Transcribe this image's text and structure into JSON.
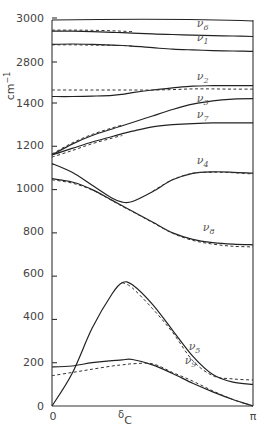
{
  "chart_data": {
    "type": "line",
    "title": "",
    "xlabel": "δC",
    "ylabel": "cm⁻¹",
    "x_ticks": [
      "0",
      "π"
    ],
    "x_range": [
      0,
      3.1416
    ],
    "y_ticks": [
      "0",
      "200",
      "400",
      "600",
      "800",
      "1000",
      "1200",
      "1400",
      "2800",
      "3000"
    ],
    "y_axis_break": [
      1400,
      2800
    ],
    "ylim": [
      0,
      3000
    ],
    "grid": false,
    "legend": "inline curve labels",
    "line_styles": {
      "solid": "calculated",
      "dashed": "second calculation"
    },
    "x": [
      0,
      0.1,
      0.2,
      0.3,
      0.35,
      0.4,
      0.5,
      0.6,
      0.7,
      0.8,
      0.9,
      1.0
    ],
    "x_unit": "fraction of π",
    "series": [
      {
        "name": "ν6",
        "style": "solid",
        "values": [
          2940,
          2940,
          2938,
          2935,
          2933,
          2931,
          2928,
          2925,
          2922,
          2920,
          2918,
          2916
        ]
      },
      {
        "name": "ν6",
        "style": "dashed",
        "values": [
          2945,
          2945,
          2944,
          2942,
          2940,
          2938,
          null,
          null,
          null,
          null,
          null,
          null
        ]
      },
      {
        "name": "ν1",
        "style": "solid",
        "values": [
          2880,
          2882,
          2880,
          2877,
          2875,
          2872,
          2865,
          2858,
          2855,
          2852,
          2850,
          2848
        ]
      },
      {
        "name": "ν1",
        "style": "dashed",
        "values": [
          2878,
          2878,
          2877,
          2876,
          2875,
          2872,
          null,
          null,
          null,
          null,
          null,
          null
        ]
      },
      {
        "name": "ν2",
        "style": "solid",
        "values": [
          1430,
          1430,
          1432,
          1435,
          1440,
          1448,
          1460,
          1470,
          1478,
          1480,
          1480,
          1480
        ]
      },
      {
        "name": "ν2",
        "style": "dashed",
        "values": [
          1460,
          1460,
          1460,
          1460,
          1460,
          1460,
          1460,
          1462,
          1465,
          1465,
          1464,
          1464
        ]
      },
      {
        "name": "ν3",
        "style": "solid",
        "values": [
          1160,
          1210,
          1250,
          1280,
          1295,
          1310,
          1340,
          1370,
          1395,
          1410,
          1418,
          1420
        ]
      },
      {
        "name": "ν3",
        "style": "dashed",
        "values": [
          1165,
          1215,
          1255,
          1285,
          1298,
          null,
          null,
          null,
          null,
          null,
          null,
          null
        ]
      },
      {
        "name": "ν7",
        "style": "solid",
        "values": [
          1160,
          1190,
          1220,
          1245,
          1258,
          1270,
          1290,
          1300,
          1305,
          1308,
          1308,
          1308
        ]
      },
      {
        "name": "ν7",
        "style": "dashed",
        "values": [
          1150,
          1180,
          1212,
          1238,
          1250,
          null,
          null,
          null,
          null,
          null,
          null,
          null
        ]
      },
      {
        "name": "ν4",
        "style": "solid",
        "values": [
          1120,
          1080,
          1020,
          960,
          942,
          945,
          990,
          1045,
          1075,
          1082,
          1080,
          1076
        ]
      },
      {
        "name": "ν4",
        "style": "dashed",
        "values": [
          null,
          null,
          null,
          null,
          null,
          null,
          992,
          1046,
          1075,
          1080,
          1078,
          1072
        ]
      },
      {
        "name": "ν8",
        "style": "solid",
        "values": [
          1050,
          1035,
          1000,
          950,
          925,
          900,
          850,
          800,
          770,
          755,
          748,
          745
        ]
      },
      {
        "name": "ν8",
        "style": "dashed",
        "values": [
          1045,
          1030,
          998,
          948,
          922,
          898,
          848,
          798,
          765,
          748,
          738,
          735
        ]
      },
      {
        "name": "ν5",
        "style": "solid",
        "values": [
          0,
          150,
          360,
          520,
          570,
          560,
          470,
          350,
          230,
          145,
          110,
          100
        ]
      },
      {
        "name": "ν5",
        "style": "dashed",
        "values": [
          null,
          null,
          null,
          null,
          570,
          545,
          450,
          340,
          210,
          140,
          125,
          120
        ]
      },
      {
        "name": "ν9",
        "style": "solid",
        "values": [
          180,
          185,
          200,
          210,
          213,
          215,
          190,
          150,
          105,
          65,
          30,
          0
        ]
      },
      {
        "name": "ν9",
        "style": "dashed",
        "values": [
          140,
          155,
          170,
          185,
          190,
          195,
          195,
          155,
          115,
          70,
          30,
          0
        ]
      }
    ],
    "curve_labels": [
      {
        "text": "ν",
        "sub": "6",
        "x_frac": 0.72,
        "y": 2950
      },
      {
        "text": "ν",
        "sub": "1",
        "x_frac": 0.72,
        "y": 2885
      },
      {
        "text": "ν",
        "sub": "2",
        "x_frac": 0.72,
        "y": 1495
      },
      {
        "text": "ν",
        "sub": "3",
        "x_frac": 0.72,
        "y": 1395
      },
      {
        "text": "ν",
        "sub": "7",
        "x_frac": 0.72,
        "y": 1320
      },
      {
        "text": "ν",
        "sub": "4",
        "x_frac": 0.72,
        "y": 1110
      },
      {
        "text": "ν",
        "sub": "8",
        "x_frac": 0.75,
        "y": 800
      },
      {
        "text": "ν",
        "sub": "5",
        "x_frac": 0.68,
        "y": 250
      },
      {
        "text": "ν",
        "sub": "9",
        "x_frac": 0.66,
        "y": 185
      }
    ]
  },
  "axis": {
    "y_unit": "cm",
    "y_unit_exp": "−1",
    "x_label_main": "δ",
    "x_label_sub": "C",
    "x_tick_start": "0",
    "x_tick_end": "π",
    "y_labels": [
      "3000",
      "2800",
      "1400",
      "1200",
      "1000",
      "800",
      "600",
      "400",
      "200",
      "0"
    ]
  }
}
